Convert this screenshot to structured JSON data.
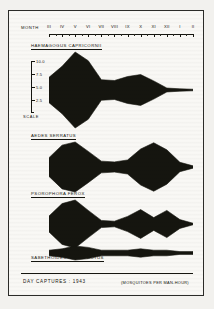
{
  "figure": {
    "axis_title": "MONTH",
    "footer_note": "DAY CAPTURES : 1943",
    "units_note": "(MOSQUITOES PER MAN-HOUR)",
    "ink_color": "#15150f",
    "paper_color": "#faf9f6"
  },
  "scale": {
    "label": "SCALE",
    "ticks": [
      "10.0",
      "7.5",
      "5.0",
      "2.5"
    ],
    "values": [
      10.0,
      7.5,
      5.0,
      2.5
    ]
  },
  "chart_data": {
    "type": "area",
    "title": "DAY CAPTURES : 1943",
    "xlabel": "MONTH",
    "ylabel": "(MOSQUITOES PER MAN-HOUR)",
    "categories": [
      "III",
      "IV",
      "V",
      "VI",
      "VII",
      "VIII",
      "IX",
      "X",
      "XI",
      "XII",
      "I",
      "II"
    ],
    "x": [
      3,
      4,
      5,
      6,
      7,
      8,
      9,
      10,
      11,
      12,
      1,
      2
    ],
    "ylim": [
      0,
      10.0
    ],
    "grid": false,
    "legend": "none",
    "style": "kite-diagram-symmetric",
    "series": [
      {
        "name": "HAEMAGOGUS CAPRICORNII",
        "values": [
          3.2,
          6.0,
          9.6,
          7.4,
          2.6,
          2.4,
          3.4,
          3.9,
          2.3,
          0.5,
          0.3,
          0.2
        ]
      },
      {
        "name": "AEDES SERRATUS",
        "values": [
          2.4,
          5.6,
          6.4,
          4.0,
          1.5,
          1.3,
          1.8,
          4.6,
          6.2,
          4.4,
          1.2,
          0.3
        ]
      },
      {
        "name": "PSOROPHORA FEROX",
        "values": [
          2.0,
          5.1,
          6.0,
          3.4,
          0.9,
          0.7,
          1.9,
          3.6,
          1.6,
          3.4,
          1.1,
          0.2
        ]
      },
      {
        "name": "SABETHOIDES IMPERFECTUS",
        "values": [
          0.2,
          0.3,
          0.5,
          0.4,
          0.2,
          0.2,
          0.2,
          0.3,
          0.2,
          0.2,
          0.1,
          0.1
        ]
      }
    ]
  }
}
